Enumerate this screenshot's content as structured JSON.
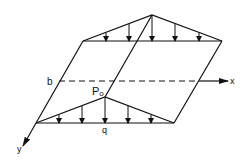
{
  "diagram": {
    "labels": {
      "b": "b",
      "p0": "P",
      "p0_sub": "o",
      "q": "q",
      "x_axis": "x",
      "y_axis": "y"
    },
    "colors": {
      "line": "#111111",
      "background": "#ffffff"
    }
  }
}
